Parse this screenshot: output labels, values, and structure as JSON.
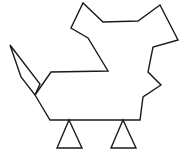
{
  "figure": {
    "title": "Abstract polygonal bird outline",
    "background_color": "#ffffff",
    "stroke_color": "#1a1a1a",
    "stroke_width": 1.4,
    "canvas": {
      "width": 187,
      "height": 154
    },
    "parts": [
      {
        "name": "beak-diamond",
        "label": "Beak",
        "closed": true,
        "points": [
          [
            10,
            45
          ],
          [
            40,
            84
          ],
          [
            35,
            95
          ],
          [
            21,
            77
          ]
        ]
      },
      {
        "name": "body-outline",
        "label": "Body and crown",
        "closed": false,
        "points": [
          [
            35,
            95
          ],
          [
            51,
            72
          ],
          [
            108,
            71
          ],
          [
            88,
            38
          ],
          [
            71,
            28
          ],
          [
            83,
            3
          ],
          [
            103,
            22
          ],
          [
            138,
            21
          ],
          [
            160,
            5
          ],
          [
            178,
            40
          ],
          [
            153,
            47
          ],
          [
            148,
            72
          ],
          [
            161,
            85
          ],
          [
            143,
            97
          ],
          [
            140,
            120
          ],
          [
            50,
            120
          ],
          [
            35,
            95
          ]
        ]
      },
      {
        "name": "left-leg-triangle",
        "label": "Left leg",
        "closed": true,
        "points": [
          [
            69,
            120
          ],
          [
            82,
            148
          ],
          [
            57,
            148
          ]
        ]
      },
      {
        "name": "right-leg-triangle",
        "label": "Right leg",
        "closed": true,
        "points": [
          [
            123,
            120
          ],
          [
            136,
            148
          ],
          [
            111,
            148
          ]
        ]
      }
    ]
  }
}
